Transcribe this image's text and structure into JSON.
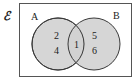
{
  "diagram": {
    "type": "venn",
    "universal_symbol": "ℰ",
    "sets": [
      {
        "name": "A",
        "label": "A",
        "only": [
          "2",
          "4"
        ]
      },
      {
        "name": "B",
        "label": "B",
        "only": [
          "5",
          "6"
        ]
      }
    ],
    "intersection": [
      "1"
    ],
    "colors": {
      "circle_fill": "#d2d2d2",
      "circle_stroke": "#3a3a3a",
      "frame_stroke": "#555555",
      "background": "#ffffff"
    }
  }
}
